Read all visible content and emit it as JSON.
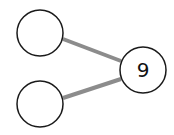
{
  "diagram": {
    "type": "number-bond",
    "whole": {
      "value": "9"
    },
    "parts": [
      {
        "value": ""
      },
      {
        "value": ""
      }
    ],
    "colors": {
      "circle_stroke": "#1a1a1a",
      "connector": "#8c8c8c",
      "background": "#ffffff"
    }
  }
}
